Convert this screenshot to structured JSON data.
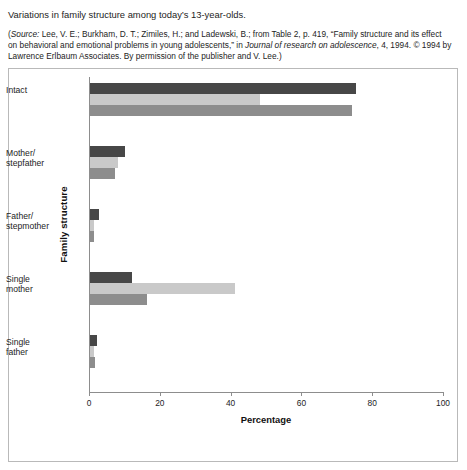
{
  "caption": {
    "title": "Variations in family structure among today’s 13-year-olds.",
    "source_part1": "(",
    "source_label": "Source:",
    "source_part2": " Lee, V. E.; Burkham, D. T.; Zimiles, H.; and Ladewski, B.; from Table 2, p. 419, “Family structure and its effect on behavioral and emotional problems in young adolescents,” in ",
    "source_journal": "Journal of research on adolescence",
    "source_part3": ", 4, 1994. © 1994 by Lawrence Erlbaum Associates. By permission of the publisher and V. Lee.)"
  },
  "colors": {
    "euro_american": "#474747",
    "african_american": "#c9c9c9",
    "hispanic": "#8d8d8d",
    "axis": "#8d8d8d",
    "frame": "#b9b9b9"
  },
  "chart_data": {
    "type": "bar",
    "orientation": "horizontal",
    "title": "",
    "xlabel": "Percentage",
    "ylabel": "Family structure",
    "xlim": [
      0,
      100
    ],
    "xticks": [
      0,
      20,
      40,
      60,
      80,
      100
    ],
    "grid": false,
    "legend_position": "bottom",
    "categories": [
      "Intact",
      "Mother/\nstepfather",
      "Father/\nstepmother",
      "Single\nmother",
      "Single\nfather"
    ],
    "series": [
      {
        "name": "Euro-American",
        "values": [
          75,
          10,
          2.5,
          12,
          2
        ]
      },
      {
        "name": "African American",
        "values": [
          48,
          8,
          1,
          41,
          1
        ]
      },
      {
        "name": "Hispanic",
        "values": [
          74,
          7,
          1,
          16,
          1.3
        ]
      }
    ]
  }
}
